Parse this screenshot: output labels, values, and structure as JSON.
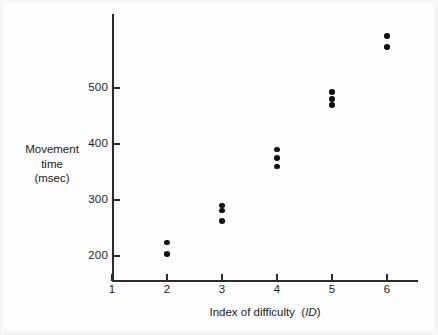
{
  "figure": {
    "background_color": "#fefefe",
    "ink_color": "#111111"
  },
  "chart_data": {
    "type": "scatter",
    "title": "",
    "subtitle": "",
    "xlabel": "Index of difficulty (ID)",
    "xlabel_plain": "Index of difficulty",
    "xlabel_italic_part": "ID",
    "ylabel": "Movement time (msec)",
    "ylabel_lines": [
      "Movement",
      "time",
      "(msec)"
    ],
    "xlim": [
      1,
      6.6
    ],
    "ylim": [
      150,
      610
    ],
    "grid": false,
    "legend": null,
    "xticks": [
      1,
      2,
      3,
      4,
      5,
      6
    ],
    "xtick_labels": [
      "1",
      "2",
      "3",
      "4",
      "5",
      "6"
    ],
    "yticks": [
      200,
      300,
      400,
      500
    ],
    "ytick_labels": [
      "200",
      "300",
      "400",
      "500"
    ],
    "marker": "filled-circle",
    "marker_color": "#111111",
    "series": [
      {
        "name": "Movement time",
        "points": [
          {
            "x": 2,
            "y": 224
          },
          {
            "x": 2,
            "y": 204
          },
          {
            "x": 3,
            "y": 290
          },
          {
            "x": 3,
            "y": 281
          },
          {
            "x": 3,
            "y": 263
          },
          {
            "x": 4,
            "y": 390
          },
          {
            "x": 4,
            "y": 375
          },
          {
            "x": 4,
            "y": 360
          },
          {
            "x": 5,
            "y": 493
          },
          {
            "x": 5,
            "y": 480
          },
          {
            "x": 5,
            "y": 470
          },
          {
            "x": 6,
            "y": 593
          },
          {
            "x": 6,
            "y": 573
          }
        ]
      }
    ]
  }
}
